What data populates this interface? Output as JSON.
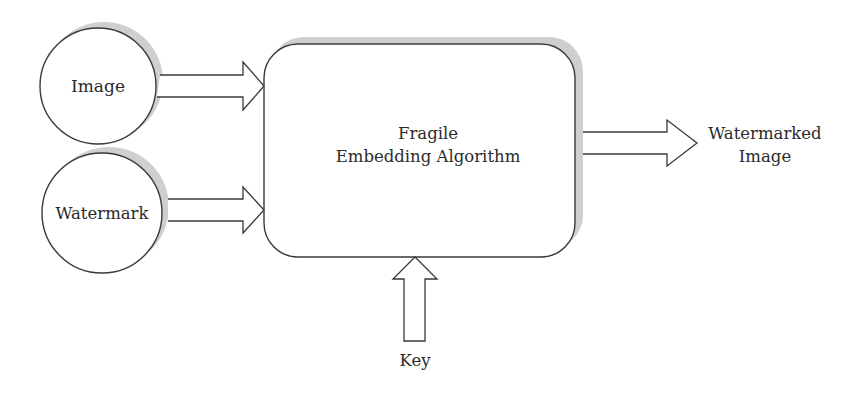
{
  "diagram": {
    "type": "flow",
    "colors": {
      "stroke": "#3a3a3a",
      "shadow": "#cfcfcf",
      "fill": "#ffffff",
      "text": "#2b2b2b"
    },
    "nodes": {
      "image": {
        "label": "Image",
        "shape": "circle"
      },
      "watermark": {
        "label": "Watermark",
        "shape": "circle"
      },
      "algorithm": {
        "label_line1": "Fragile",
        "label_line2": "Embedding Algorithm",
        "shape": "rounded-rectangle"
      },
      "output": {
        "label_line1": "Watermarked",
        "label_line2": "Image",
        "shape": "text"
      },
      "key": {
        "label": "Key",
        "shape": "text"
      }
    },
    "edges": [
      {
        "from": "image",
        "to": "algorithm",
        "style": "block-arrow"
      },
      {
        "from": "watermark",
        "to": "algorithm",
        "style": "block-arrow"
      },
      {
        "from": "algorithm",
        "to": "output",
        "style": "block-arrow"
      },
      {
        "from": "key",
        "to": "algorithm",
        "style": "block-arrow"
      }
    ]
  }
}
